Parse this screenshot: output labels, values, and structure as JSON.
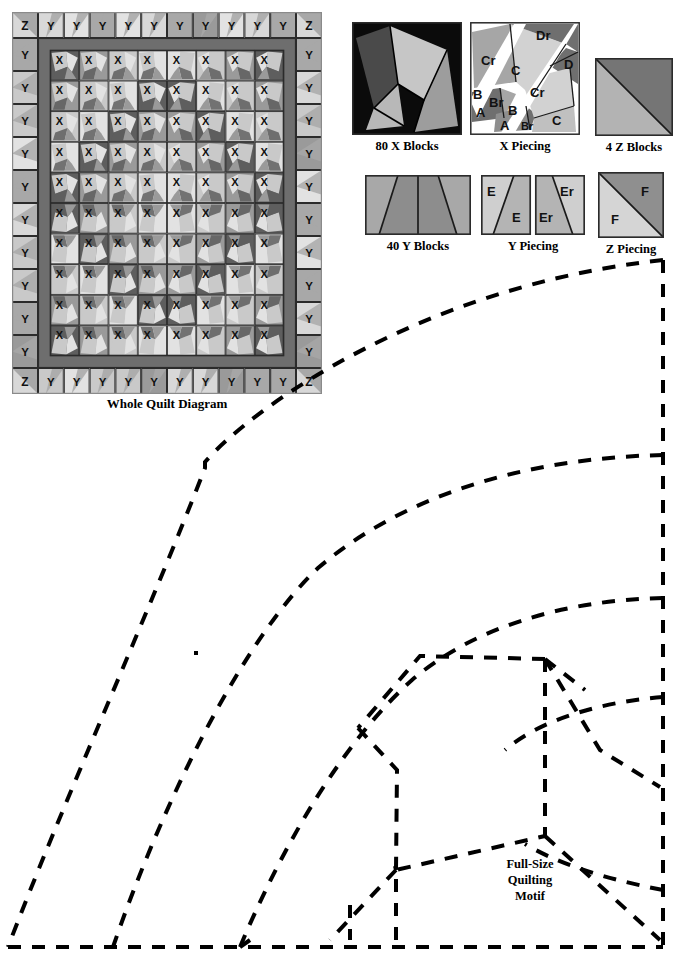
{
  "page": {
    "background": "#ffffff",
    "ink": "#000000"
  },
  "quilt": {
    "caption": "Whole Quilt Diagram",
    "corner_label": "Z",
    "border_label": "Y",
    "block_label": "X",
    "grid": {
      "cols": 8,
      "rows": 10
    },
    "border_counts": {
      "top": 10,
      "bottom": 10,
      "left": 10,
      "right": 10
    },
    "colors": {
      "frame": "#6e6e6e",
      "sashing": "#6b6b6b",
      "block_dark": "#5e5e5e",
      "block_mid": "#9a9a9a",
      "block_light": "#c9c9c9",
      "block_pale": "#e2e2e2",
      "border_light": "#d8d8d8",
      "border_mid": "#a8a8a8",
      "outline": "#2b2b2b"
    }
  },
  "figures": [
    {
      "id": "x-blocks",
      "caption": "80 X Blocks",
      "type": "x-block",
      "colors": {
        "bg": "#0b0b0b",
        "light": "#c6c6c6",
        "mid": "#9d9d9d",
        "dark": "#4a4a4a",
        "line": "#000000"
      }
    },
    {
      "id": "x-piecing",
      "caption": "X Piecing",
      "type": "x-piecing",
      "labels": [
        "Dr",
        "Cr",
        "C",
        "D",
        "B",
        "Br",
        "A",
        "B",
        "A",
        "Br",
        "Cr",
        "C"
      ],
      "colors": {
        "light": "#d2d2d2",
        "mid": "#a6a6a6",
        "dark": "#6f6f6f",
        "seam": "#ffffff",
        "line": "#1a1a1a"
      }
    },
    {
      "id": "z-blocks",
      "caption": "4 Z Blocks",
      "type": "z-block",
      "colors": {
        "light": "#b3b3b3",
        "dark": "#757575",
        "line": "#1a1a1a"
      }
    },
    {
      "id": "y-blocks",
      "caption": "40 Y Blocks",
      "type": "y-block",
      "colors": {
        "light": "#a8a8a8",
        "dark": "#8d8d8d",
        "line": "#1a1a1a"
      }
    },
    {
      "id": "y-piecing",
      "caption": "Y Piecing",
      "type": "y-piecing",
      "labels": [
        "E",
        "E",
        "Er",
        "Er"
      ],
      "colors": {
        "light": "#cfcfcf",
        "mid": "#b4b4b4",
        "line": "#1a1a1a"
      }
    },
    {
      "id": "z-piecing",
      "caption": "Z Piecing",
      "type": "z-piecing",
      "labels": [
        "F",
        "F"
      ],
      "colors": {
        "light": "#d5d5d5",
        "dark": "#8f8f8f",
        "line": "#1a1a1a"
      }
    }
  ],
  "motif": {
    "label_lines": [
      "Full-Size",
      "Quilting",
      "Motif"
    ],
    "stroke": "#000000",
    "stroke_width": 4,
    "dash": "13 11",
    "arc_count": 5
  }
}
